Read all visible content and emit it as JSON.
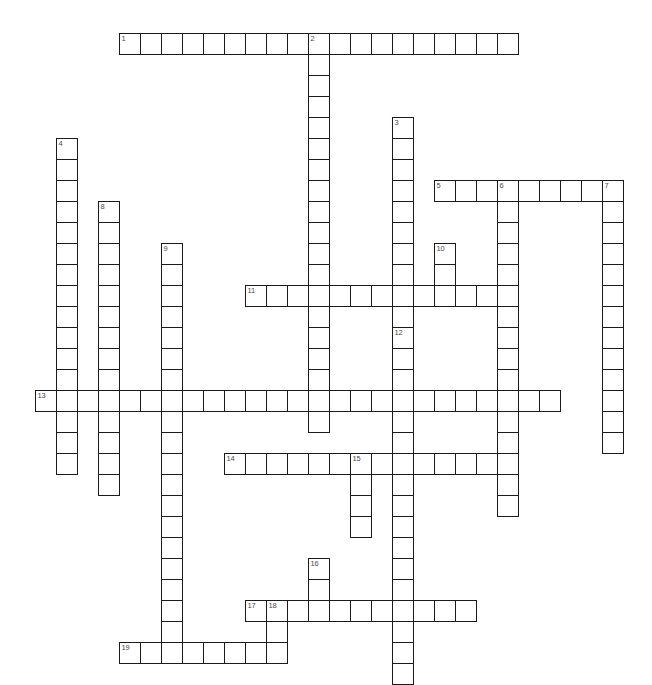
{
  "puzzle": {
    "title": "Crossword Puzzle Grid",
    "grid": {
      "cell_size": 21,
      "origin_x": 35,
      "origin_y": 33,
      "columns": 29,
      "rows": 30,
      "cell_fill_color": "#ffffff",
      "cell_border_color": "#1b1b1b",
      "number_color": "#4a4a4a",
      "background_color": "#ffffff"
    },
    "entries": [
      {
        "number": "1",
        "direction": "across",
        "row": 0,
        "col": 4,
        "length": 19
      },
      {
        "number": "2",
        "direction": "down",
        "row": 0,
        "col": 13,
        "length": 19
      },
      {
        "number": "3",
        "direction": "down",
        "row": 4,
        "col": 17,
        "length": 12
      },
      {
        "number": "4",
        "direction": "down",
        "row": 5,
        "col": 1,
        "length": 16
      },
      {
        "number": "5",
        "direction": "across",
        "row": 7,
        "col": 19,
        "length": 9
      },
      {
        "number": "6",
        "direction": "down",
        "row": 7,
        "col": 22,
        "length": 16
      },
      {
        "number": "7",
        "direction": "down",
        "row": 7,
        "col": 27,
        "length": 13
      },
      {
        "number": "8",
        "direction": "down",
        "row": 8,
        "col": 3,
        "length": 14
      },
      {
        "number": "9",
        "direction": "down",
        "row": 10,
        "col": 6,
        "length": 19
      },
      {
        "number": "10",
        "direction": "down",
        "row": 10,
        "col": 19,
        "length": 3
      },
      {
        "number": "11",
        "direction": "across",
        "row": 12,
        "col": 10,
        "length": 12
      },
      {
        "number": "12",
        "direction": "down",
        "row": 14,
        "col": 17,
        "length": 17
      },
      {
        "number": "13",
        "direction": "across",
        "row": 17,
        "col": 0,
        "length": 25
      },
      {
        "number": "14",
        "direction": "across",
        "row": 20,
        "col": 9,
        "length": 13
      },
      {
        "number": "15",
        "direction": "down",
        "row": 20,
        "col": 15,
        "length": 4
      },
      {
        "number": "16",
        "direction": "down",
        "row": 25,
        "col": 13,
        "length": 3
      },
      {
        "number": "17",
        "direction": "across",
        "row": 27,
        "col": 10,
        "length": 11
      },
      {
        "number": "18",
        "direction": "down",
        "row": 27,
        "col": 11,
        "length": 3
      },
      {
        "number": "19",
        "direction": "across",
        "row": 29,
        "col": 4,
        "length": 8
      }
    ],
    "numbered_cells": [
      {
        "number": "1",
        "row": 0,
        "col": 4
      },
      {
        "number": "2",
        "row": 0,
        "col": 13
      },
      {
        "number": "3",
        "row": 4,
        "col": 17
      },
      {
        "number": "4",
        "row": 5,
        "col": 1
      },
      {
        "number": "5",
        "row": 7,
        "col": 19
      },
      {
        "number": "6",
        "row": 7,
        "col": 22
      },
      {
        "number": "7",
        "row": 7,
        "col": 27
      },
      {
        "number": "8",
        "row": 8,
        "col": 3
      },
      {
        "number": "9",
        "row": 10,
        "col": 6
      },
      {
        "number": "10",
        "row": 10,
        "col": 19
      },
      {
        "number": "11",
        "row": 12,
        "col": 10
      },
      {
        "number": "12",
        "row": 14,
        "col": 17
      },
      {
        "number": "13",
        "row": 17,
        "col": 0
      },
      {
        "number": "14",
        "row": 20,
        "col": 9
      },
      {
        "number": "15",
        "row": 20,
        "col": 15
      },
      {
        "number": "16",
        "row": 25,
        "col": 13
      },
      {
        "number": "17",
        "row": 27,
        "col": 10
      },
      {
        "number": "18",
        "row": 27,
        "col": 11
      },
      {
        "number": "19",
        "row": 29,
        "col": 4
      }
    ]
  }
}
